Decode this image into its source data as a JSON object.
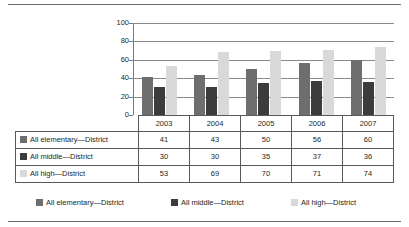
{
  "chart_data": {
    "type": "bar",
    "title": "",
    "xlabel": "",
    "ylabel": "",
    "categories": [
      "2003",
      "2004",
      "2005",
      "2006",
      "2007"
    ],
    "series": [
      {
        "name": "All elementary—District",
        "values": [
          41,
          43,
          50,
          56,
          60
        ],
        "color": "#6e6e6e"
      },
      {
        "name": "All middle—District",
        "values": [
          30,
          30,
          35,
          37,
          36
        ],
        "color": "#3c3c3c"
      },
      {
        "name": "All high—District",
        "values": [
          53,
          69,
          70,
          71,
          74
        ],
        "color": "#d9d9d9"
      }
    ],
    "ylim": [
      0,
      100
    ],
    "yticks": [
      0,
      20,
      40,
      60,
      80,
      100
    ],
    "ytick_labels": [
      "0",
      "20",
      "40",
      "60",
      "80",
      "100"
    ],
    "grid": true,
    "legend_position": "bottom"
  },
  "table": {
    "column_headers": [
      "2003",
      "2004",
      "2005",
      "2006",
      "2007"
    ],
    "rows": [
      {
        "label": "All elementary—District",
        "swatch": "#6e6e6e",
        "values": [
          "41",
          "43",
          "50",
          "56",
          "60"
        ]
      },
      {
        "label": "All middle—District",
        "swatch": "#3c3c3c",
        "values": [
          "30",
          "30",
          "35",
          "37",
          "36"
        ]
      },
      {
        "label": "All high—District",
        "swatch": "#d9d9d9",
        "values": [
          "53",
          "69",
          "70",
          "71",
          "74"
        ]
      }
    ]
  },
  "legend": {
    "items": [
      {
        "label": "All elementary—District",
        "color": "#6e6e6e"
      },
      {
        "label": "All middle—District",
        "color": "#3c3c3c"
      },
      {
        "label": "All high—District",
        "color": "#d9d9d9"
      }
    ]
  }
}
